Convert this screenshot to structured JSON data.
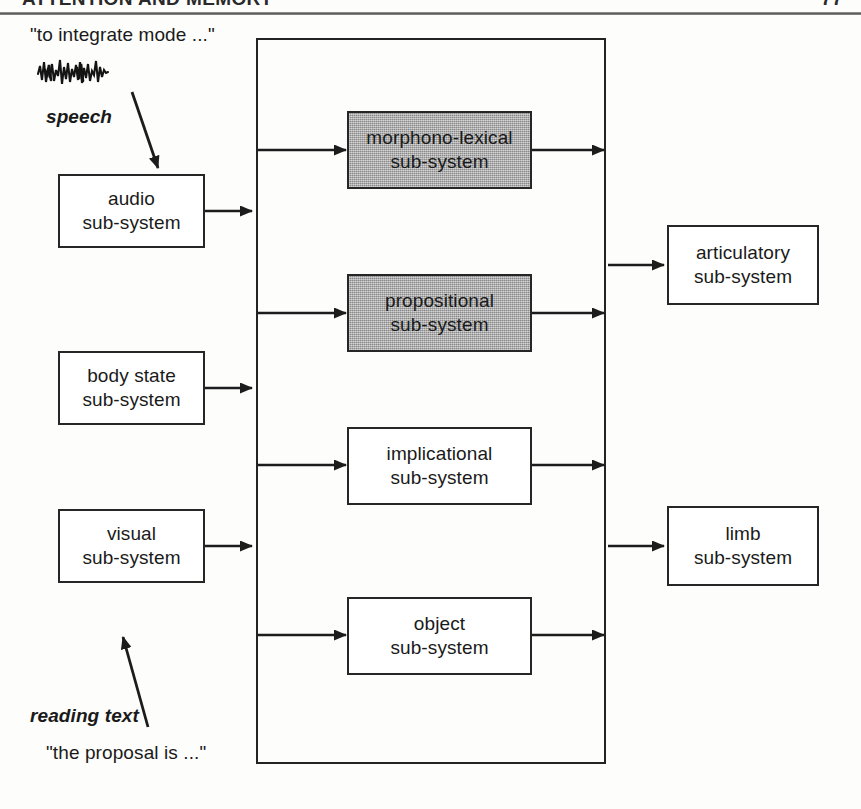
{
  "page": {
    "header_left": "ATTENTION AND MEMORY",
    "header_right": "77",
    "background": "#fdfdfc",
    "ink": "#1a1a1a",
    "shade_color": "#a9a9a9"
  },
  "diagram": {
    "container_label": "central sub-systems",
    "input_boxes": [
      {
        "id": "audio",
        "line1": "audio",
        "line2": "sub-system"
      },
      {
        "id": "body-state",
        "line1": "body state",
        "line2": "sub-system"
      },
      {
        "id": "visual",
        "line1": "visual",
        "line2": "sub-system"
      }
    ],
    "central_boxes": [
      {
        "id": "morphono-lexical",
        "line1": "morphono-lexical",
        "line2": "sub-system",
        "shaded": true
      },
      {
        "id": "propositional",
        "line1": "propositional",
        "line2": "sub-system",
        "shaded": true
      },
      {
        "id": "implicational",
        "line1": "implicational",
        "line2": "sub-system",
        "shaded": false
      },
      {
        "id": "object",
        "line1": "object",
        "line2": "sub-system",
        "shaded": false
      }
    ],
    "output_boxes": [
      {
        "id": "articulatory",
        "line1": "articulatory",
        "line2": "sub-system"
      },
      {
        "id": "limb",
        "line1": "limb",
        "line2": "sub-system"
      }
    ],
    "annotations": {
      "speech_quote": "\"to integrate mode ...\"",
      "speech_label": "speech",
      "waveform_icon": "speech-waveform-icon",
      "reading_label": "reading text",
      "reading_quote": "\"the proposal is ...\""
    }
  }
}
